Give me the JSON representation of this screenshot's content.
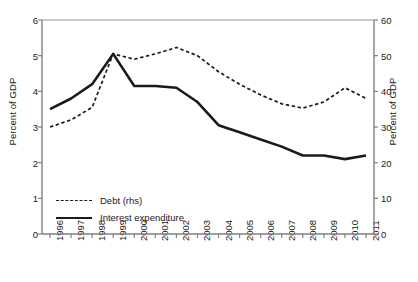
{
  "chart_data": {
    "type": "line",
    "title": "",
    "subtitle": "",
    "xlabel": "",
    "ylabel": "Percent of GDP",
    "ylabel_right": "Percent of GDP",
    "categories": [
      "1996",
      "1997",
      "1998",
      "1999",
      "2000",
      "2001",
      "2002",
      "2003",
      "2004",
      "2005",
      "2006",
      "2007",
      "2008",
      "2009",
      "2010",
      "2011"
    ],
    "x": [
      1996,
      1997,
      1998,
      1999,
      2000,
      2001,
      2002,
      2003,
      2004,
      2005,
      2006,
      2007,
      2008,
      2009,
      2010,
      2011
    ],
    "ylim": [
      0,
      6
    ],
    "ylim_right": [
      0,
      60
    ],
    "yticks": [
      0,
      1,
      2,
      3,
      4,
      5,
      6
    ],
    "yticks_right": [
      0,
      10,
      20,
      30,
      40,
      50,
      60
    ],
    "grid": false,
    "legend_position": "lower-left inside axes",
    "series": [
      {
        "name": "Debt (rhs)",
        "axis": "right",
        "style": "dashed",
        "color": "#1a1a1a",
        "values": [
          30.0,
          32.0,
          35.5,
          50.5,
          49.0,
          50.5,
          52.3,
          50.0,
          45.5,
          42.0,
          39.0,
          36.5,
          35.3,
          37.0,
          41.0,
          38.0
        ]
      },
      {
        "name": "Interest expenditure",
        "axis": "left",
        "style": "solid",
        "color": "#1a1a1a",
        "values": [
          3.5,
          3.8,
          4.2,
          5.05,
          4.15,
          4.15,
          4.1,
          3.7,
          3.05,
          2.85,
          2.65,
          2.45,
          2.2,
          2.2,
          2.1,
          2.2
        ]
      }
    ]
  },
  "axes": {
    "left_title": "Percent of GDP",
    "right_title": "Percent of GDP",
    "left_ticks": [
      "6",
      "5",
      "4",
      "3",
      "2",
      "1",
      "0"
    ],
    "right_ticks": [
      "60",
      "50",
      "40",
      "30",
      "20",
      "10",
      "0"
    ],
    "x_ticks": [
      "1996",
      "1997",
      "1998",
      "1999",
      "2000",
      "2001",
      "2002",
      "2003",
      "2004",
      "2005",
      "2006",
      "2007",
      "2008",
      "2009",
      "2010",
      "2011"
    ]
  },
  "legend": {
    "items": [
      {
        "label": "Debt (rhs)",
        "style": "dashed"
      },
      {
        "label": "Interest expenditure",
        "style": "solid"
      }
    ]
  }
}
